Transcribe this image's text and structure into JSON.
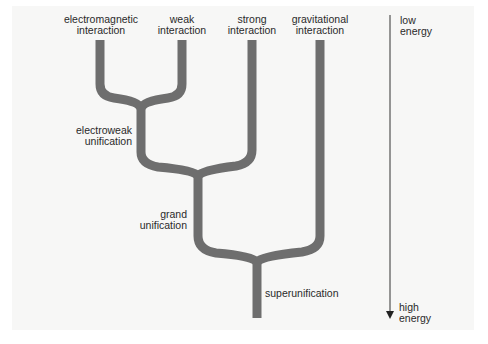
{
  "diagram": {
    "title": "",
    "forces": [
      {
        "label_line1": "electromagnetic",
        "label_line2": "interaction"
      },
      {
        "label_line1": "weak",
        "label_line2": "interaction"
      },
      {
        "label_line1": "strong",
        "label_line2": "interaction"
      },
      {
        "label_line1": "gravitational",
        "label_line2": "interaction"
      }
    ],
    "unifications": [
      {
        "label_line1": "electroweak",
        "label_line2": "unification"
      },
      {
        "label_line1": "grand",
        "label_line2": "unification"
      },
      {
        "label_line1": "superunification",
        "label_line2": ""
      }
    ],
    "energy_axis": {
      "top_line1": "low",
      "top_line2": "energy",
      "bottom_line1": "high",
      "bottom_line2": "energy"
    },
    "colors": {
      "branch": "#6e6e6e",
      "arrow": "#333333",
      "background": "#f7f7f6"
    }
  }
}
